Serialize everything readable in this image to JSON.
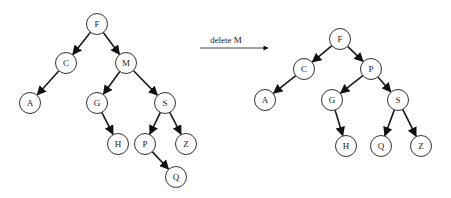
{
  "diagram": {
    "operation": {
      "label": "delete M",
      "arrow": {
        "x1": 200,
        "y1": 48,
        "x2": 268,
        "y2": 48
      },
      "label_pos": {
        "x": 226,
        "y": 43
      }
    },
    "trees": [
      {
        "name": "before",
        "nodes": [
          {
            "id": "F",
            "label": "F",
            "x": 97,
            "y": 24
          },
          {
            "id": "C",
            "label": "C",
            "x": 66,
            "y": 63
          },
          {
            "id": "M",
            "label": "M",
            "x": 126,
            "y": 63
          },
          {
            "id": "A",
            "label": "A",
            "x": 30,
            "y": 103
          },
          {
            "id": "G",
            "label": "G",
            "x": 97,
            "y": 103
          },
          {
            "id": "S",
            "label": "S",
            "x": 165,
            "y": 103
          },
          {
            "id": "H",
            "label": "H",
            "x": 118,
            "y": 144
          },
          {
            "id": "P",
            "label": "P",
            "x": 145,
            "y": 144
          },
          {
            "id": "Z",
            "label": "Z",
            "x": 186,
            "y": 144
          },
          {
            "id": "Q",
            "label": "Q",
            "x": 176,
            "y": 177
          }
        ],
        "edges": [
          [
            "F",
            "C"
          ],
          [
            "F",
            "M"
          ],
          [
            "C",
            "A"
          ],
          [
            "M",
            "G"
          ],
          [
            "M",
            "S"
          ],
          [
            "G",
            "H"
          ],
          [
            "S",
            "P"
          ],
          [
            "S",
            "Z"
          ],
          [
            "P",
            "Q"
          ]
        ]
      },
      {
        "name": "after",
        "nodes": [
          {
            "id": "F",
            "label": "F",
            "x": 340,
            "y": 39
          },
          {
            "id": "C",
            "label": "C",
            "x": 304,
            "y": 69
          },
          {
            "id": "P",
            "label": "P",
            "x": 371,
            "y": 69
          },
          {
            "id": "A",
            "label": "A",
            "x": 265,
            "y": 100
          },
          {
            "id": "G",
            "label": "G",
            "x": 332,
            "y": 100
          },
          {
            "id": "S",
            "label": "S",
            "x": 398,
            "y": 100
          },
          {
            "id": "H",
            "label": "H",
            "x": 346,
            "y": 146
          },
          {
            "id": "Q",
            "label": "Q",
            "x": 381,
            "y": 146
          },
          {
            "id": "Z",
            "label": "Z",
            "x": 421,
            "y": 146
          }
        ],
        "edges": [
          [
            "F",
            "C"
          ],
          [
            "F",
            "P"
          ],
          [
            "C",
            "A"
          ],
          [
            "P",
            "G"
          ],
          [
            "P",
            "S"
          ],
          [
            "G",
            "H"
          ],
          [
            "S",
            "Q"
          ],
          [
            "S",
            "Z"
          ]
        ]
      }
    ],
    "node_radius": 10.5
  }
}
